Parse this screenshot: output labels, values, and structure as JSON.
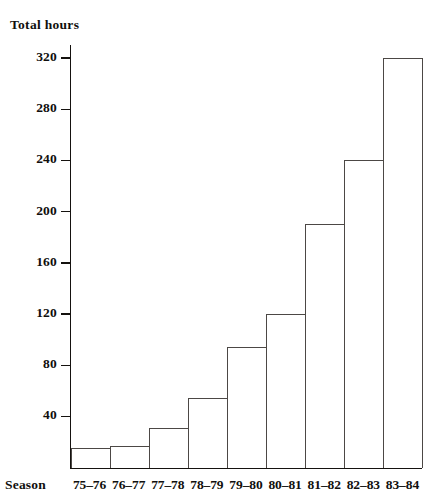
{
  "chart_data": {
    "type": "bar",
    "title": "",
    "ylabel": "Total hours",
    "xlabel": "Season",
    "categories": [
      "75–76",
      "76–77",
      "77–78",
      "78–79",
      "79–80",
      "80–81",
      "81–82",
      "82–83",
      "83–84"
    ],
    "values": [
      15,
      17,
      31,
      54,
      94,
      120,
      190,
      240,
      320
    ],
    "ylim": [
      0,
      330
    ],
    "ytick_labels": [
      "40",
      "80",
      "120",
      "160",
      "200",
      "240",
      "280",
      "320"
    ],
    "ytick_values": [
      40,
      80,
      120,
      160,
      200,
      240,
      280,
      320
    ],
    "grid": false,
    "legend": false,
    "bar_fill_color": "#ffffff",
    "bar_edge_color": "#4c4845",
    "axis_color": "#15120f",
    "text_color": "#100f0d"
  }
}
